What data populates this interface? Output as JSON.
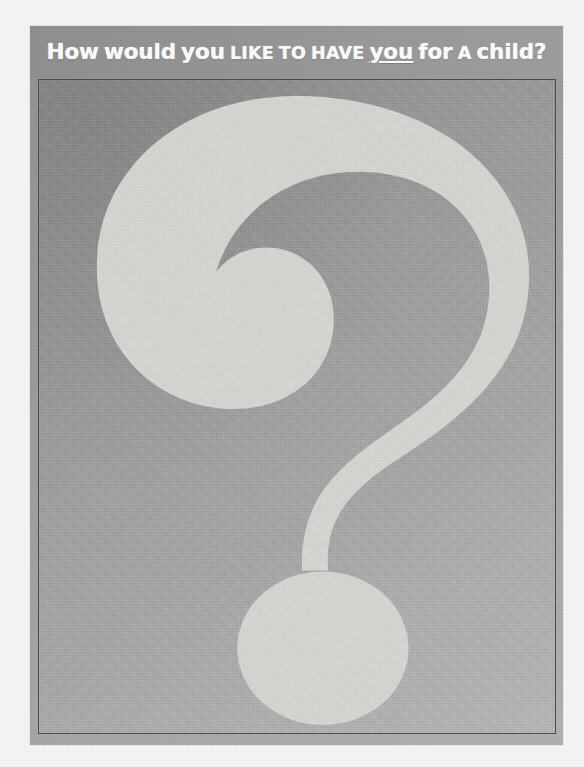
{
  "poster": {
    "headline": {
      "full_text": "How would you like to have you for a child?",
      "segments": [
        {
          "text": "How",
          "style": "caps-lead"
        },
        {
          "text": "would",
          "style": "normal"
        },
        {
          "text": "you",
          "style": "normal"
        },
        {
          "text": "like",
          "style": "smallcaps"
        },
        {
          "text": "to",
          "style": "smallcaps"
        },
        {
          "text": "have",
          "style": "smallcaps"
        },
        {
          "text": "you",
          "style": "underlined"
        },
        {
          "text": "for",
          "style": "normal"
        },
        {
          "text": "a",
          "style": "smallcaps"
        },
        {
          "text": "child",
          "style": "normal"
        },
        {
          "text": "?",
          "style": "normal"
        }
      ],
      "emphasis_word": "you",
      "emphasis_style": "underline"
    },
    "artwork": {
      "subject": "question-mark",
      "description": "Large stylized question mark occupying the poster field",
      "symbol": "?"
    },
    "colors": {
      "page_background": "#f4f4f3",
      "poster_background_top_left": "#8c8c8c",
      "poster_background_bottom_right": "#b6b6b6",
      "headline_band": "#989898",
      "headline_text": "#fbfbfb",
      "question_mark_fill": "#d5d5d2",
      "frame_border": "#4c4c4c"
    }
  }
}
